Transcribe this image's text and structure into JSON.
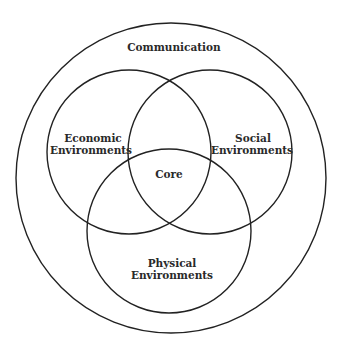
{
  "diagram": {
    "type": "venn",
    "outer": {
      "label": "Communication",
      "cx": 171,
      "cy": 178,
      "r": 155
    },
    "circles": [
      {
        "id": "economic",
        "label_lines": [
          "Economic",
          "Environments"
        ],
        "cx": 129,
        "cy": 152,
        "r": 82
      },
      {
        "id": "social",
        "label_lines": [
          "Social",
          "Environments"
        ],
        "cx": 210,
        "cy": 152,
        "r": 82
      },
      {
        "id": "physical",
        "label_lines": [
          "Physical",
          "Environments"
        ],
        "cx": 169,
        "cy": 231,
        "r": 82
      }
    ],
    "center": {
      "label": "Core"
    },
    "stroke_color": "#222222",
    "background_color": "#ffffff"
  }
}
